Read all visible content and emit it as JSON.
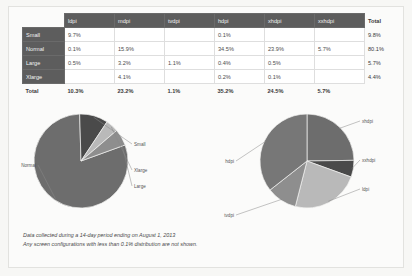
{
  "table": {
    "corner_label": "",
    "columns": [
      "ldpi",
      "mdpi",
      "tvdpi",
      "hdpi",
      "xhdpi",
      "xxhdpi"
    ],
    "total_column_label": "Total",
    "total_row_label": "Total",
    "rows": [
      {
        "label": "Small",
        "values": [
          "9.7%",
          "",
          "",
          "0.1%",
          "",
          ""
        ],
        "total": "9.8%"
      },
      {
        "label": "Normal",
        "values": [
          "0.1%",
          "15.9%",
          "",
          "34.5%",
          "23.9%",
          "5.7%"
        ],
        "total": "80.1%"
      },
      {
        "label": "Large",
        "values": [
          "0.5%",
          "3.2%",
          "1.1%",
          "0.4%",
          "0.5%",
          ""
        ],
        "total": "5.7%"
      },
      {
        "label": "Xlarge",
        "values": [
          "",
          "4.1%",
          "",
          "0.2%",
          "0.1%",
          ""
        ],
        "total": "4.4%"
      }
    ],
    "totals": [
      "10.3%",
      "23.2%",
      "1.1%",
      "35.2%",
      "24.5%",
      "5.7%"
    ],
    "grand_total": ""
  },
  "caption": {
    "line1": "Data collected during a 14-day period ending on August 1, 2013",
    "line2": "Any screen configurations with less than 0.1% distribution are not shown."
  },
  "chart_data": [
    {
      "type": "pie",
      "title": "Screen size distribution",
      "name": "screen-size-pie",
      "labels": [
        "Normal",
        "Small",
        "Xlarge",
        "Large"
      ],
      "values": [
        80.1,
        9.8,
        4.4,
        5.7
      ],
      "colors": [
        "#6d6d6d",
        "#4a4a4a",
        "#b9b9b9",
        "#8e8e8e"
      ],
      "legend": "callout-labels",
      "start_angle_deg": -20
    },
    {
      "type": "pie",
      "title": "Screen density distribution",
      "name": "screen-density-pie",
      "labels": [
        "xhdpi",
        "xxhdpi",
        "ldpi",
        "tvdpi",
        "hdpi"
      ],
      "values": [
        24.5,
        5.7,
        23.2,
        10.3,
        35.2
      ],
      "colors": [
        "#6d6d6d",
        "#4a4a4a",
        "#b9b9b9",
        "#8e8e8e",
        "#777777"
      ],
      "legend": "callout-labels",
      "start_angle_deg": -90
    }
  ],
  "colors": {
    "header_band": "#5d5d5d",
    "page_bg": "#fbfbfa",
    "text": "#4b4b4b"
  }
}
